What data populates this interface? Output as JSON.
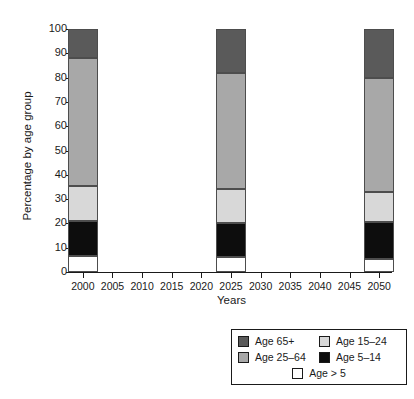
{
  "chart_data": {
    "type": "bar",
    "subtype": "stacked-bar",
    "title": "",
    "xlabel": "Years",
    "ylabel": "Percentage by age group",
    "categories": [
      "2000",
      "2025",
      "2050"
    ],
    "x": [
      2000,
      2025,
      2050
    ],
    "xlim": [
      1998,
      2052
    ],
    "ylim": [
      0,
      100
    ],
    "y_ticks": [
      0,
      10,
      20,
      30,
      40,
      50,
      60,
      70,
      80,
      90,
      100
    ],
    "x_ticks": [
      2000,
      2005,
      2010,
      2015,
      2020,
      2025,
      2030,
      2035,
      2040,
      2045,
      2050
    ],
    "x_tick_labels": [
      "2000",
      "2005",
      "2010",
      "2015",
      "2020",
      "2025",
      "2030",
      "2035",
      "2040",
      "2045",
      "2050"
    ],
    "grid": false,
    "legend_position": "bottom-right",
    "stack_order_bottom_to_top": [
      "Age > 5",
      "Age 5–14",
      "Age 15–24",
      "Age 25–64",
      "Age 65+"
    ],
    "series": [
      {
        "name": "Age > 5",
        "color": "#ffffff",
        "values": [
          6.5,
          6.0,
          5.5
        ]
      },
      {
        "name": "Age 5–14",
        "color": "#0d0d0d",
        "values": [
          14.5,
          14.0,
          15.0
        ]
      },
      {
        "name": "Age 15–24",
        "color": "#d8d8d8",
        "values": [
          14.5,
          14.0,
          12.5
        ]
      },
      {
        "name": "Age 25–64",
        "color": "#a8a8a8",
        "values": [
          52.5,
          48.0,
          47.0
        ]
      },
      {
        "name": "Age 65+",
        "color": "#5a5a5a",
        "values": [
          12.0,
          18.0,
          20.0
        ]
      }
    ],
    "cumulative_tops": {
      "2000": [
        6.5,
        21.0,
        35.5,
        88.0,
        100.0
      ],
      "2025": [
        6.0,
        20.0,
        34.0,
        82.0,
        100.0
      ],
      "2050": [
        5.5,
        20.5,
        33.0,
        80.0,
        100.0
      ]
    }
  },
  "legend": {
    "rows": [
      [
        {
          "label": "Age 65+",
          "color": "#5a5a5a"
        },
        {
          "label": "Age 15–24",
          "color": "#d8d8d8"
        }
      ],
      [
        {
          "label": "Age 25–64",
          "color": "#a8a8a8"
        },
        {
          "label": "Age 5–14",
          "color": "#0d0d0d"
        }
      ],
      [
        {
          "label": "Age > 5",
          "color": "#ffffff"
        }
      ]
    ]
  }
}
